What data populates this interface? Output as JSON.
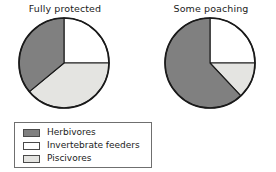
{
  "figure": {
    "background_color": "#ffffff",
    "outline_color": "#1a1a1a"
  },
  "charts": [
    {
      "id": "fully-protected",
      "title": "Fully protected"
    },
    {
      "id": "some-poaching",
      "title": "Some poaching"
    }
  ],
  "legend": {
    "items": [
      {
        "label": "Herbivores",
        "color": "#808080"
      },
      {
        "label": "Invertebrate feeders",
        "color": "#ffffff"
      },
      {
        "label": "Piscivores",
        "color": "#e4e4e1"
      }
    ]
  },
  "chart_data": [
    {
      "type": "pie",
      "title": "Fully protected",
      "categories": [
        "Invertebrate feeders",
        "Piscivores",
        "Herbivores"
      ],
      "values": [
        25,
        39,
        36
      ],
      "colors": [
        "#ffffff",
        "#e4e4e1",
        "#808080"
      ],
      "start_angle_deg": 0,
      "direction": "clockwise",
      "units": "percent",
      "legend_position": "below-left",
      "grid": false
    },
    {
      "type": "pie",
      "title": "Some poaching",
      "categories": [
        "Invertebrate feeders",
        "Piscivores",
        "Herbivores"
      ],
      "values": [
        25,
        13,
        62
      ],
      "colors": [
        "#ffffff",
        "#e4e4e1",
        "#808080"
      ],
      "start_angle_deg": 0,
      "direction": "clockwise",
      "units": "percent",
      "legend_position": "below-left",
      "grid": false
    }
  ]
}
